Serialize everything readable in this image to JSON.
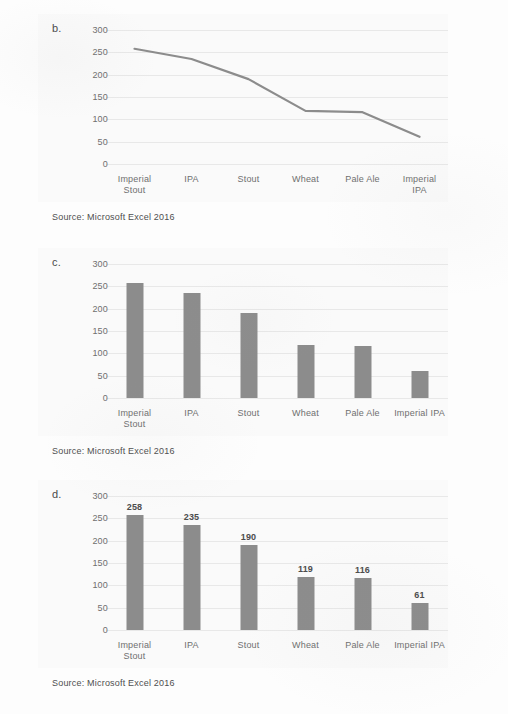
{
  "page": {
    "background": "#fdfdfd",
    "panel_background": "#fafafa",
    "series_color": "#8c8c8c",
    "gridline_color": "#e8e8e8",
    "text_color": "#6f6f6f"
  },
  "figures": [
    {
      "letter": "b.",
      "source": "Source: Microsoft Excel 2016",
      "wrap_last_label": true
    },
    {
      "letter": "c.",
      "source": "Source: Microsoft Excel 2016",
      "wrap_last_label": false
    },
    {
      "letter": "d.",
      "source": "Source: Microsoft Excel 2016",
      "wrap_last_label": false
    }
  ],
  "chart_data": [
    {
      "type": "line",
      "title": "",
      "xlabel": "",
      "ylabel": "",
      "categories": [
        "Imperial Stout",
        "IPA",
        "Stout",
        "Wheat",
        "Pale Ale",
        "Imperial IPA"
      ],
      "category_lines": [
        [
          "Imperial",
          "Stout"
        ],
        [
          "IPA"
        ],
        [
          "Stout"
        ],
        [
          "Wheat"
        ],
        [
          "Pale Ale"
        ],
        [
          "Imperial",
          "IPA"
        ]
      ],
      "values": [
        258,
        235,
        190,
        119,
        116,
        61
      ],
      "ylim": [
        0,
        300
      ],
      "yticks": [
        0,
        50,
        100,
        150,
        200,
        250,
        300
      ],
      "ytick_labels": [
        "0",
        "50",
        "100",
        "150",
        "200",
        "250",
        "300"
      ],
      "grid": true,
      "legend": "none",
      "data_labels": false,
      "line_color": "#8c8c8c"
    },
    {
      "type": "bar",
      "title": "",
      "xlabel": "",
      "ylabel": "",
      "categories": [
        "Imperial Stout",
        "IPA",
        "Stout",
        "Wheat",
        "Pale Ale",
        "Imperial IPA"
      ],
      "category_lines": [
        [
          "Imperial",
          "Stout"
        ],
        [
          "IPA"
        ],
        [
          "Stout"
        ],
        [
          "Wheat"
        ],
        [
          "Pale Ale"
        ],
        [
          "Imperial IPA"
        ]
      ],
      "values": [
        258,
        235,
        190,
        119,
        116,
        61
      ],
      "ylim": [
        0,
        300
      ],
      "yticks": [
        0,
        50,
        100,
        150,
        200,
        250,
        300
      ],
      "ytick_labels": [
        "0",
        "50",
        "100",
        "150",
        "200",
        "250",
        "300"
      ],
      "grid": true,
      "legend": "none",
      "data_labels": false,
      "bar_color": "#8c8c8c"
    },
    {
      "type": "bar",
      "title": "",
      "xlabel": "",
      "ylabel": "",
      "categories": [
        "Imperial Stout",
        "IPA",
        "Stout",
        "Wheat",
        "Pale Ale",
        "Imperial IPA"
      ],
      "category_lines": [
        [
          "Imperial",
          "Stout"
        ],
        [
          "IPA"
        ],
        [
          "Stout"
        ],
        [
          "Wheat"
        ],
        [
          "Pale Ale"
        ],
        [
          "Imperial IPA"
        ]
      ],
      "values": [
        258,
        235,
        190,
        119,
        116,
        61
      ],
      "value_labels": [
        "258",
        "235",
        "190",
        "119",
        "116",
        "61"
      ],
      "ylim": [
        0,
        300
      ],
      "yticks": [
        0,
        50,
        100,
        150,
        200,
        250,
        300
      ],
      "ytick_labels": [
        "0",
        "50",
        "100",
        "150",
        "200",
        "250",
        "300"
      ],
      "grid": true,
      "legend": "none",
      "data_labels": true,
      "bar_color": "#8c8c8c"
    }
  ]
}
